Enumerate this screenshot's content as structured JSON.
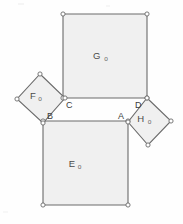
{
  "figure": {
    "background_color": "#fefefe",
    "fill_color": "#f0f0f0",
    "stroke_color": "#6b6b6b",
    "label_color": "#4a4a4a",
    "vertex_marker_color": "#6b6b6b",
    "regions": [
      {
        "id": "square-g",
        "name": "square-go",
        "label_main": "G",
        "label_sub": "o",
        "shape": "square",
        "points": "63,14 147,14 147,98 63,98",
        "label_x": 97,
        "label_y": 59,
        "sub_dx": 9,
        "sub_dy": 2,
        "vertices": [
          {
            "x": 63,
            "y": 14
          },
          {
            "x": 147,
            "y": 14
          },
          {
            "x": 147,
            "y": 98
          },
          {
            "x": 63,
            "y": 98
          }
        ]
      },
      {
        "id": "square-e",
        "name": "square-eo",
        "label_main": "E",
        "label_sub": "o",
        "shape": "square",
        "points": "43,121 128,121 128,205 43,205",
        "label_x": 72,
        "label_y": 167,
        "sub_dx": 7.5,
        "sub_dy": 2,
        "vertices": [
          {
            "x": 43,
            "y": 121
          },
          {
            "x": 128,
            "y": 121
          },
          {
            "x": 128,
            "y": 205
          },
          {
            "x": 43,
            "y": 205
          }
        ]
      },
      {
        "id": "square-f",
        "name": "square-fo",
        "label_main": "F",
        "label_sub": "o",
        "shape": "rotated-square",
        "points": "40,74 65,98 43,123 17,99",
        "label_x": 33,
        "label_y": 99,
        "sub_dx": 7,
        "sub_dy": 2,
        "vertices": [
          {
            "x": 40,
            "y": 74
          },
          {
            "x": 65,
            "y": 98
          },
          {
            "x": 43,
            "y": 123
          },
          {
            "x": 17,
            "y": 99
          }
        ]
      },
      {
        "id": "square-h",
        "name": "square-ho",
        "label_main": "H",
        "label_sub": "o",
        "shape": "rotated-square",
        "points": "147,98 171,121 148,145 128,122",
        "label_x": 141,
        "label_y": 122,
        "sub_dx": 8.5,
        "sub_dy": 2,
        "vertices": [
          {
            "x": 147,
            "y": 98
          },
          {
            "x": 171,
            "y": 121
          },
          {
            "x": 148,
            "y": 145
          },
          {
            "x": 128,
            "y": 122
          }
        ]
      }
    ],
    "vertex_labels": [
      {
        "id": "vertex-a",
        "name": "vertex-label-a",
        "text": "A",
        "x": 118,
        "y": 119
      },
      {
        "id": "vertex-b",
        "name": "vertex-label-b",
        "text": "B",
        "x": 47,
        "y": 119
      },
      {
        "id": "vertex-c",
        "name": "vertex-label-c",
        "text": "C",
        "x": 66,
        "y": 108
      },
      {
        "id": "vertex-d",
        "name": "vertex-label-d",
        "text": "D",
        "x": 135,
        "y": 108
      }
    ],
    "vertex_marker_radius": 2.1
  }
}
